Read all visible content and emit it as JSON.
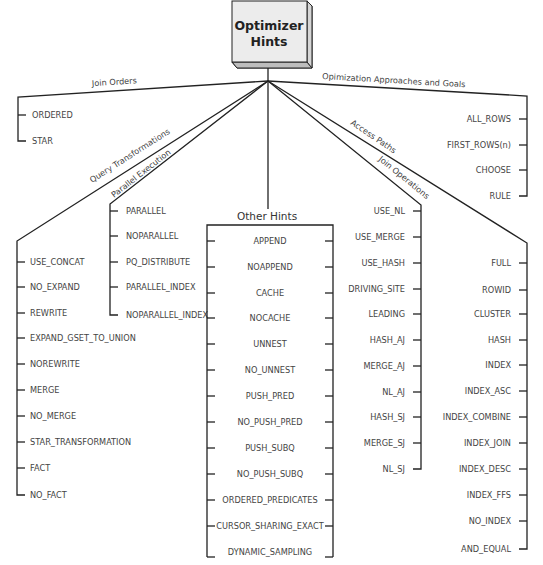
{
  "root": {
    "title_line1": "Optimizer",
    "title_line2": "Hints"
  },
  "groups": {
    "join_orders": {
      "label": "Join Orders",
      "items": [
        "ORDERED",
        "STAR"
      ]
    },
    "optimization_approaches": {
      "label": "Opimization Approaches and Goals",
      "items": [
        "ALL_ROWS",
        "FIRST_ROWS(n)",
        "CHOOSE",
        "RULE"
      ]
    },
    "query_transformations": {
      "label": "Query Transformations",
      "items": [
        "USE_CONCAT",
        "NO_EXPAND",
        "REWRITE",
        "EXPAND_GSET_TO_UNION",
        "NOREWRITE",
        "MERGE",
        "NO_MERGE",
        "STAR_TRANSFORMATION",
        "FACT",
        "NO_FACT"
      ]
    },
    "parallel_execution": {
      "label": "Parallel Execution",
      "items": [
        "PARALLEL",
        "NOPARALLEL",
        "PQ_DISTRIBUTE",
        "PARALLEL_INDEX",
        "NOPARALLEL_INDEX"
      ]
    },
    "other_hints": {
      "label": "Other Hints",
      "items": [
        "APPEND",
        "NOAPPEND",
        "CACHE",
        "NOCACHE",
        "UNNEST",
        "NO_UNNEST",
        "PUSH_PRED",
        "NO_PUSH_PRED",
        "PUSH_SUBQ",
        "NO_PUSH_SUBQ",
        "ORDERED_PREDICATES",
        "CURSOR_SHARING_EXACT",
        "DYNAMIC_SAMPLING"
      ]
    },
    "join_operations": {
      "label": "Join Operations",
      "items": [
        "USE_NL",
        "USE_MERGE",
        "USE_HASH",
        "DRIVING_SITE",
        "LEADING",
        "HASH_AJ",
        "MERGE_AJ",
        "NL_AJ",
        "HASH_SJ",
        "MERGE_SJ",
        "NL_SJ"
      ]
    },
    "access_paths": {
      "label": "Access Paths",
      "items": [
        "FULL",
        "ROWID",
        "CLUSTER",
        "HASH",
        "INDEX",
        "INDEX_ASC",
        "INDEX_COMBINE",
        "INDEX_JOIN",
        "INDEX_DESC",
        "INDEX_FFS",
        "NO_INDEX",
        "AND_EQUAL"
      ]
    }
  }
}
